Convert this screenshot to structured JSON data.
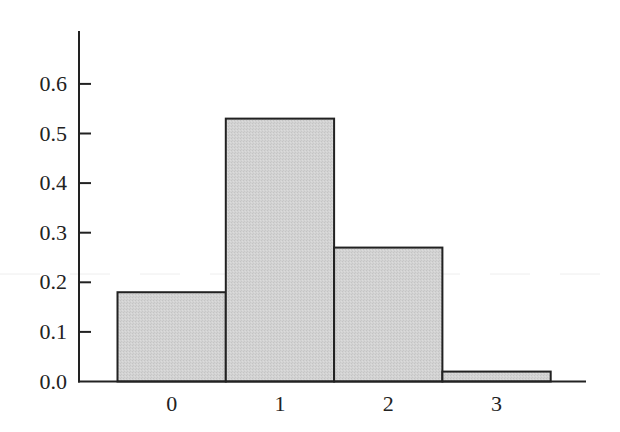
{
  "chart_data": {
    "type": "bar",
    "title": "",
    "xlabel": "",
    "ylabel": "",
    "categories": [
      "0",
      "1",
      "2",
      "3"
    ],
    "values": [
      0.18,
      0.53,
      0.27,
      0.02
    ],
    "ylim": [
      0,
      0.7
    ],
    "yticks": [
      "0.0",
      "0.1",
      "0.2",
      "0.3",
      "0.4",
      "0.5",
      "0.6"
    ],
    "grid": false,
    "legend": null,
    "bar_fill": "#d3d3d3",
    "bar_edge": "#222222",
    "axis_color": "#222222"
  }
}
